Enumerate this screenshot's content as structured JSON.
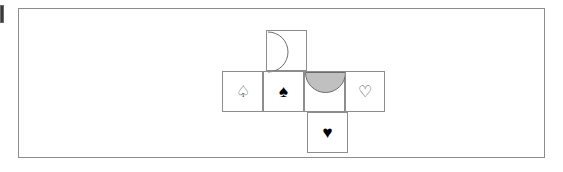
{
  "figure": {
    "frame": {
      "stroke_color": "#8d8d8d",
      "fill_color": "#ffffff"
    },
    "grid": {
      "stroke_color": "#8d8d8d",
      "columns": 4,
      "rows": 3,
      "cell_size_px": 41
    },
    "colors": {
      "solid_suit": "#000000",
      "hollow_suit": "#4a4a4a",
      "shape_fill_gray": "#c0c0c0",
      "shape_stroke": "#6d6d6d",
      "line": "#8d8d8d",
      "background": "#ffffff"
    },
    "cells": [
      {
        "id": "cell-top",
        "position": "top",
        "row": 1,
        "column": 2,
        "content_type": "semicircle",
        "content_name": "semicircle-outline-right",
        "symbol": "",
        "filled": false,
        "orientation": "flat-edge-left-bulge-right",
        "fill": "none",
        "stroke": "#6d6d6d"
      },
      {
        "id": "cell-mid-1",
        "position": "middle-row-column-1",
        "row": 2,
        "column": 1,
        "content_type": "suit",
        "content_name": "spade-outline",
        "symbol": "♤",
        "filled": false,
        "orientation": "",
        "fill": "none",
        "stroke": "#4a4a4a"
      },
      {
        "id": "cell-mid-2",
        "position": "middle-row-column-2",
        "row": 2,
        "column": 2,
        "content_type": "suit",
        "content_name": "spade-solid",
        "symbol": "♠",
        "filled": true,
        "orientation": "",
        "fill": "#000000",
        "stroke": "#000000"
      },
      {
        "id": "cell-mid-3",
        "position": "middle-row-column-3",
        "row": 2,
        "column": 3,
        "content_type": "semicircle",
        "content_name": "semicircle-filled-down",
        "symbol": "",
        "filled": true,
        "orientation": "flat-edge-top-bulge-down",
        "fill": "#c0c0c0",
        "stroke": "#6d6d6d"
      },
      {
        "id": "cell-mid-4",
        "position": "middle-row-column-4",
        "row": 2,
        "column": 4,
        "content_type": "suit",
        "content_name": "heart-outline",
        "symbol": "♡",
        "filled": false,
        "orientation": "",
        "fill": "none",
        "stroke": "#4a4a4a"
      },
      {
        "id": "cell-bottom",
        "position": "bottom",
        "row": 3,
        "column": 3,
        "content_type": "suit",
        "content_name": "heart-solid",
        "symbol": "♥",
        "filled": true,
        "orientation": "",
        "fill": "#000000",
        "stroke": "#000000"
      }
    ]
  }
}
